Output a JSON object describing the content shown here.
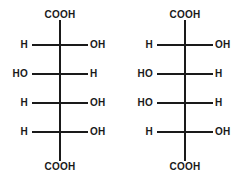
{
  "diagram": {
    "type": "fischer-projection-pair",
    "background_color": "#ffffff",
    "stroke_color": "#1a1a1a",
    "structures": [
      {
        "id": "left",
        "backbone_x": 60,
        "top_cap": "COOH",
        "bottom_cap": "COOH",
        "stereocenters": [
          {
            "y": 44,
            "left": "H",
            "right": "OH"
          },
          {
            "y": 73,
            "left": "HO",
            "right": "H"
          },
          {
            "y": 102,
            "left": "H",
            "right": "OH"
          },
          {
            "y": 131,
            "left": "H",
            "right": "OH"
          }
        ]
      },
      {
        "id": "right",
        "backbone_x": 185,
        "top_cap": "COOH",
        "bottom_cap": "COOH",
        "stereocenters": [
          {
            "y": 44,
            "left": "H",
            "right": "OH"
          },
          {
            "y": 73,
            "left": "HO",
            "right": "H"
          },
          {
            "y": 102,
            "left": "HO",
            "right": "H"
          },
          {
            "y": 131,
            "left": "H",
            "right": "OH"
          }
        ]
      }
    ]
  }
}
